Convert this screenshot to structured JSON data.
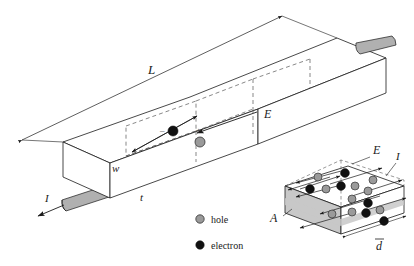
{
  "figure": {
    "type": "isometric-technical-diagram",
    "background": "#ffffff",
    "ink_color": "#1a1a1a",
    "metal_fill": "#b0b0b0",
    "face_fill": "#c8c8c8",
    "hole_fill": "#9a9a9a",
    "electron_fill": "#111111"
  },
  "main_bar": {
    "labels": {
      "length": "L",
      "width": "w",
      "thickness": "t",
      "field": "E",
      "current_left": "I"
    },
    "carriers": {
      "electron_sign": "–",
      "hole_sign": "+",
      "electron_name": "electron",
      "hole_name": "hole"
    }
  },
  "inset": {
    "labels": {
      "area": "A",
      "field": "E",
      "current": "I",
      "drift_distance": "d"
    },
    "drift_overbar": true,
    "carrier_counts": {
      "electrons": 8,
      "holes": 9
    }
  },
  "legend": {
    "items": [
      {
        "marker": "hole-marker",
        "label": "hole"
      },
      {
        "marker": "electron-marker",
        "label": "electron"
      }
    ]
  }
}
